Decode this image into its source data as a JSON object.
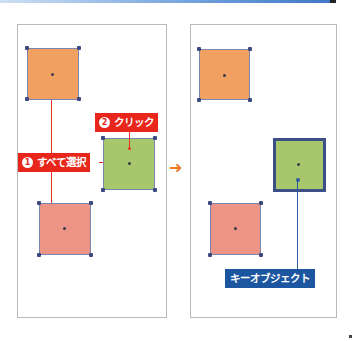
{
  "diagram": {
    "before_panel": {
      "labels": {
        "select_all": {
          "number": "1",
          "text": "すべて選択"
        },
        "click": {
          "number": "2",
          "text": "クリック"
        }
      },
      "objects": [
        {
          "name": "orange-square",
          "color": "#f0a060"
        },
        {
          "name": "green-square",
          "color": "#a8c66c"
        },
        {
          "name": "pink-square",
          "color": "#ec9485"
        }
      ]
    },
    "transition_arrow": "➜",
    "after_panel": {
      "labels": {
        "key_object": "キーオブジェクト"
      },
      "objects": [
        {
          "name": "orange-square",
          "color": "#f0a060"
        },
        {
          "name": "green-square-key",
          "color": "#a8c66c",
          "border": "#3c4f86"
        },
        {
          "name": "pink-square",
          "color": "#ec9485"
        }
      ]
    },
    "colors": {
      "callout_red": "#e8261b",
      "callout_blue": "#1d56a0",
      "arrow_orange": "#ee7a22",
      "handle": "#3d4a80"
    }
  }
}
